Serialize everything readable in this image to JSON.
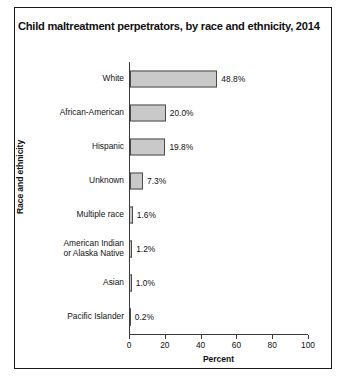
{
  "figure": {
    "title": "Child maltreatment perpetrators, by race and ethnicity, 2014"
  },
  "chart_data": {
    "type": "bar",
    "orientation": "horizontal",
    "title": "Child maltreatment perpetrators, by race and ethnicity, 2014",
    "xlabel": "Percent",
    "ylabel": "Race and ethnicity",
    "xlim": [
      0,
      100
    ],
    "xticks": [
      0,
      20,
      40,
      60,
      80,
      100
    ],
    "xticklabels": [
      "0",
      "20",
      "40",
      "60",
      "80",
      "100"
    ],
    "grid": false,
    "legend": null,
    "categories": [
      "White",
      "African-American",
      "Hispanic",
      "Unknown",
      "Multiple race",
      "American Indian\nor Alaska Native",
      "Asian",
      "Pacific Islander"
    ],
    "values": [
      48.8,
      20.0,
      19.8,
      7.3,
      1.6,
      1.2,
      1.0,
      0.2
    ],
    "value_labels": [
      "48.8%",
      "20.0%",
      "19.8%",
      "7.3%",
      "1.6%",
      "1.2%",
      "1.0%",
      "0.2%"
    ],
    "bar_color": "#c9c9c9",
    "bar_edge_color": "#4a4a4a",
    "bars": [
      {
        "label": "White",
        "label_line1": "White",
        "label_line2": "",
        "value": 48.8,
        "value_label": "48.8%"
      },
      {
        "label": "African-American",
        "label_line1": "African-American",
        "label_line2": "",
        "value": 20.0,
        "value_label": "20.0%"
      },
      {
        "label": "Hispanic",
        "label_line1": "Hispanic",
        "label_line2": "",
        "value": 19.8,
        "value_label": "19.8%"
      },
      {
        "label": "Unknown",
        "label_line1": "Unknown",
        "label_line2": "",
        "value": 7.3,
        "value_label": "7.3%"
      },
      {
        "label": "Multiple race",
        "label_line1": "Multiple race",
        "label_line2": "",
        "value": 1.6,
        "value_label": "1.6%"
      },
      {
        "label": "American Indian or Alaska Native",
        "label_line1": "American Indian",
        "label_line2": "or Alaska Native",
        "value": 1.2,
        "value_label": "1.2%"
      },
      {
        "label": "Asian",
        "label_line1": "Asian",
        "label_line2": "",
        "value": 1.0,
        "value_label": "1.0%"
      },
      {
        "label": "Pacific Islander",
        "label_line1": "Pacific Islander",
        "label_line2": "",
        "value": 0.2,
        "value_label": "0.2%"
      }
    ]
  }
}
